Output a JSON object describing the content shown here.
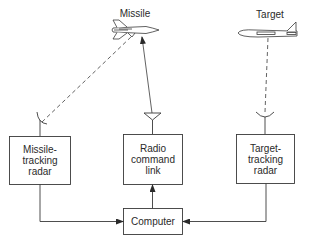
{
  "diagram": {
    "title_objects": {
      "missile_label": "Missile",
      "target_label": "Target"
    },
    "blocks": [
      {
        "id": "missile-tracking-radar",
        "label": "Missile-\ntracking\nradar"
      },
      {
        "id": "radio-command-link",
        "label": "Radio\ncommand\nlink"
      },
      {
        "id": "target-tracking-radar",
        "label": "Target-\ntracking\nradar"
      },
      {
        "id": "computer",
        "label": "Computer"
      }
    ],
    "connections": [
      {
        "from": "missile-tracking-radar",
        "to": "missile",
        "style": "dashed",
        "meaning": "radar tracking beam"
      },
      {
        "from": "target-tracking-radar",
        "to": "target",
        "style": "dashed",
        "meaning": "radar tracking beam"
      },
      {
        "from": "radio-command-link",
        "to": "missile",
        "style": "solid-arrow",
        "meaning": "command signal"
      },
      {
        "from": "missile-tracking-radar",
        "to": "computer",
        "style": "solid-arrow"
      },
      {
        "from": "target-tracking-radar",
        "to": "computer",
        "style": "solid-arrow"
      },
      {
        "from": "computer",
        "to": "radio-command-link",
        "style": "solid-arrow"
      }
    ],
    "colors": {
      "line": "#3a3a3a",
      "text": "#2a2a2a",
      "background": "#ffffff"
    }
  }
}
